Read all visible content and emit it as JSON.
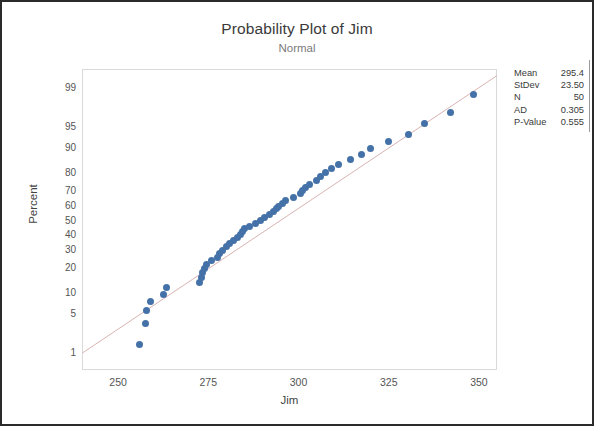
{
  "chart_data": {
    "type": "scatter",
    "title": "Probability Plot of Jim",
    "subtitle": "Normal",
    "xlabel": "Jim",
    "ylabel": "Percent",
    "xlim": [
      240,
      355
    ],
    "xticks": [
      250,
      275,
      300,
      325,
      350
    ],
    "yticks": [
      1,
      5,
      10,
      20,
      30,
      40,
      50,
      60,
      70,
      80,
      90,
      95,
      99
    ],
    "ytick_labels": [
      "1",
      "5",
      "10",
      "20",
      "30",
      "40",
      "50",
      "60",
      "70",
      "80",
      "90",
      "95",
      "99"
    ],
    "grid": false,
    "legend": "none",
    "marker_color": "#4472a8",
    "line_color": "#d9b3b3",
    "fit_line": {
      "mean": 295.4,
      "stdev": 23.5
    },
    "x": [
      256.0,
      257.5,
      258.0,
      259.0,
      262.5,
      263.5,
      272.5,
      273.0,
      273.5,
      274.0,
      274.5,
      276.0,
      277.5,
      278.0,
      279.0,
      280.0,
      281.0,
      282.0,
      283.0,
      284.0,
      284.5,
      285.0,
      286.5,
      288.0,
      289.5,
      290.5,
      292.0,
      293.0,
      294.0,
      294.5,
      295.5,
      296.5,
      298.5,
      300.5,
      301.0,
      302.0,
      303.0,
      305.0,
      306.0,
      307.5,
      309.0,
      311.0,
      314.5,
      317.5,
      320.0,
      325.0,
      330.5,
      335.0,
      342.0,
      348.5
    ],
    "percent": [
      1.4,
      3.4,
      5.4,
      7.4,
      9.4,
      11.4,
      13.4,
      15.4,
      17.4,
      19.4,
      21.4,
      23.4,
      25.4,
      27.4,
      29.4,
      31.4,
      33.4,
      35.4,
      37.4,
      39.4,
      41.4,
      43.4,
      45.4,
      47.4,
      49.4,
      51.4,
      53.4,
      55.4,
      57.4,
      59.4,
      61.4,
      63.4,
      65.4,
      67.4,
      69.4,
      71.4,
      73.4,
      75.4,
      77.4,
      79.4,
      81.4,
      83.4,
      85.4,
      87.4,
      89.4,
      91.4,
      93.4,
      95.4,
      97.0,
      98.6
    ]
  },
  "stats": {
    "title": "statistics",
    "rows": [
      {
        "key": "Mean",
        "value": "295.4"
      },
      {
        "key": "StDev",
        "value": "23.50"
      },
      {
        "key": "N",
        "value": "50"
      },
      {
        "key": "AD",
        "value": "0.305"
      },
      {
        "key": "P-Value",
        "value": "0.555"
      }
    ]
  }
}
